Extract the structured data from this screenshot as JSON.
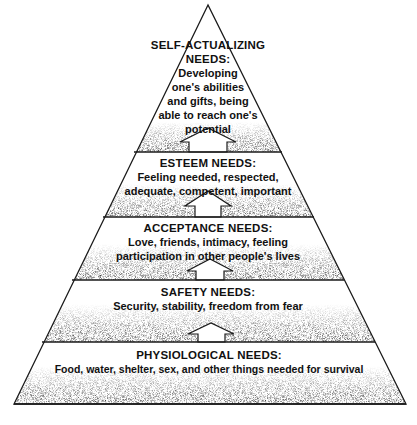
{
  "diagram": {
    "type": "pyramid",
    "colors": {
      "line": "#1a1a1a",
      "stipple": "#555555",
      "background": "#ffffff"
    },
    "levels": [
      {
        "title": "SELF-ACTUALIZING NEEDS:",
        "title_lines": [
          "SELF-ACTUALIZING",
          "NEEDS:"
        ],
        "description": "Developing one's abilities and gifts, being able to reach one's potential",
        "desc_lines": [
          "Developing",
          "one's abilities",
          "and gifts, being",
          "able to reach one's",
          "potential"
        ]
      },
      {
        "title": "ESTEEM NEEDS:",
        "title_lines": [
          "ESTEEM NEEDS:"
        ],
        "description": "Feeling needed, respected, adequate, competent, important",
        "desc_lines": [
          "Feeling needed, respected,",
          "adequate, competent, important"
        ]
      },
      {
        "title": "ACCEPTANCE NEEDS:",
        "title_lines": [
          "ACCEPTANCE NEEDS:"
        ],
        "description": "Love, friends, intimacy, feeling participation in other people's lives",
        "desc_lines": [
          "Love, friends, intimacy, feeling",
          "participation in other people's lives"
        ]
      },
      {
        "title": "SAFETY NEEDS:",
        "title_lines": [
          "SAFETY NEEDS:"
        ],
        "description": "Security, stability, freedom from fear",
        "desc_lines": [
          "Security, stability, freedom from fear"
        ]
      },
      {
        "title": "PHYSIOLOGICAL NEEDS:",
        "title_lines": [
          "PHYSIOLOGICAL NEEDS:"
        ],
        "description": "Food, water, shelter, sex, and other things needed for survival",
        "desc_lines": [
          "Food, water, shelter, sex, and other things needed for survival"
        ]
      }
    ],
    "arrows": [
      {
        "from": "ESTEEM NEEDS",
        "to": "SELF-ACTUALIZING NEEDS",
        "icon": "up-arrow-icon"
      },
      {
        "from": "ACCEPTANCE NEEDS",
        "to": "ESTEEM NEEDS",
        "icon": "up-arrow-icon"
      },
      {
        "from": "SAFETY NEEDS",
        "to": "ACCEPTANCE NEEDS",
        "icon": "up-arrow-icon"
      },
      {
        "from": "PHYSIOLOGICAL NEEDS",
        "to": "SAFETY NEEDS",
        "icon": "up-arrow-icon"
      }
    ]
  }
}
